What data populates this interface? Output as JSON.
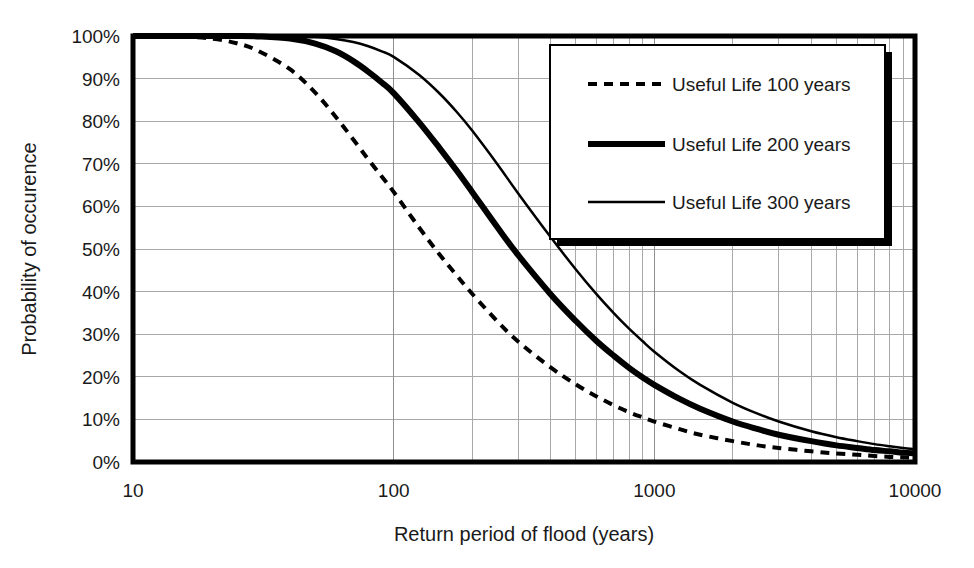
{
  "chart_data": {
    "type": "line",
    "title": "",
    "xlabel": "Return period of flood (years)",
    "ylabel": "Probability of occurence",
    "xscale": "log",
    "xlim": [
      10,
      10000
    ],
    "ylim": [
      0,
      1
    ],
    "grid": true,
    "legend_position": "top-right",
    "x_tick_labels": [
      "10",
      "100",
      "1000",
      "10000"
    ],
    "x_tick_values": [
      10,
      100,
      1000,
      10000
    ],
    "x_minor_ticks": [
      200,
      300,
      400,
      500,
      600,
      700,
      800,
      900,
      2000,
      3000,
      4000,
      5000,
      6000,
      7000,
      8000,
      9000
    ],
    "y_tick_labels": [
      "0%",
      "10%",
      "20%",
      "30%",
      "40%",
      "50%",
      "60%",
      "70%",
      "80%",
      "90%",
      "100%"
    ],
    "y_tick_values": [
      0,
      0.1,
      0.2,
      0.3,
      0.4,
      0.5,
      0.6,
      0.7,
      0.8,
      0.9,
      1.0
    ],
    "formula": "P = 1 - (1 - 1/T)^n",
    "x": [
      10,
      15,
      20,
      25,
      30,
      40,
      50,
      60,
      70,
      80,
      90,
      100,
      125,
      150,
      175,
      200,
      250,
      300,
      400,
      500,
      600,
      700,
      800,
      900,
      1000,
      1250,
      1500,
      2000,
      2500,
      3000,
      4000,
      5000,
      6000,
      7000,
      8000,
      9000,
      10000
    ],
    "series": [
      {
        "name": "Useful Life 100 years",
        "n": 100,
        "style": "dotted",
        "stroke_width": 4,
        "values": [
          1.0,
          0.999,
          0.994,
          0.983,
          0.966,
          0.922,
          0.867,
          0.81,
          0.757,
          0.71,
          0.67,
          0.634,
          0.551,
          0.487,
          0.437,
          0.395,
          0.33,
          0.283,
          0.222,
          0.182,
          0.154,
          0.133,
          0.117,
          0.105,
          0.095,
          0.077,
          0.064,
          0.049,
          0.039,
          0.033,
          0.025,
          0.02,
          0.017,
          0.014,
          0.012,
          0.011,
          0.01
        ]
      },
      {
        "name": "Useful Life 200 years",
        "n": 200,
        "style": "solid-thick",
        "stroke_width": 6,
        "values": [
          1.0,
          1.0,
          1.0,
          1.0,
          0.999,
          0.994,
          0.982,
          0.964,
          0.941,
          0.916,
          0.891,
          0.866,
          0.798,
          0.737,
          0.683,
          0.634,
          0.551,
          0.486,
          0.394,
          0.331,
          0.284,
          0.249,
          0.221,
          0.199,
          0.181,
          0.148,
          0.125,
          0.095,
          0.077,
          0.064,
          0.049,
          0.039,
          0.033,
          0.028,
          0.025,
          0.022,
          0.02
        ]
      },
      {
        "name": "Useful Life 300 years",
        "n": 300,
        "style": "solid-thin",
        "stroke_width": 2.5,
        "values": [
          1.0,
          1.0,
          1.0,
          1.0,
          1.0,
          1.0,
          0.998,
          0.993,
          0.986,
          0.976,
          0.964,
          0.951,
          0.909,
          0.865,
          0.821,
          0.778,
          0.699,
          0.631,
          0.528,
          0.452,
          0.394,
          0.349,
          0.313,
          0.284,
          0.259,
          0.213,
          0.181,
          0.139,
          0.113,
          0.095,
          0.072,
          0.058,
          0.049,
          0.042,
          0.037,
          0.033,
          0.03
        ]
      }
    ]
  },
  "legend": {
    "items": [
      {
        "label": "Useful Life 100 years",
        "marker": "dotted-line-swatch"
      },
      {
        "label": "Useful Life 200 years",
        "marker": "thick-line-swatch"
      },
      {
        "label": "Useful Life 300 years",
        "marker": "thin-line-swatch"
      }
    ]
  },
  "axes": {
    "x_title": "Return period of flood (years)",
    "y_title": "Probability of occurence"
  }
}
